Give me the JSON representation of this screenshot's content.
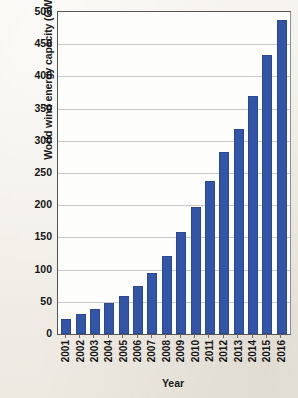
{
  "chart_data": {
    "type": "bar",
    "title": "",
    "xlabel": "Year",
    "ylabel": "World wind energy capacity (GW)",
    "categories": [
      "2001",
      "2002",
      "2003",
      "2004",
      "2005",
      "2006",
      "2007",
      "2008",
      "2009",
      "2010",
      "2011",
      "2012",
      "2013",
      "2014",
      "2015",
      "2016"
    ],
    "values": [
      24,
      31,
      39,
      48,
      59,
      74,
      94,
      121,
      159,
      198,
      238,
      283,
      318,
      370,
      433,
      487
    ],
    "series": [
      {
        "name": "World wind energy capacity",
        "values": [
          24,
          31,
          39,
          48,
          59,
          74,
          94,
          121,
          159,
          198,
          238,
          283,
          318,
          370,
          433,
          487
        ]
      }
    ],
    "ylim": [
      0,
      500
    ],
    "ytick_step": 50,
    "yticks": [
      0,
      50,
      100,
      150,
      200,
      250,
      300,
      350,
      400,
      450,
      500
    ],
    "ytick_labels": [
      "0",
      "50",
      "100",
      "150",
      "200",
      "250",
      "300",
      "350",
      "400",
      "450",
      "500"
    ],
    "grid": "horizontal",
    "legend": "none",
    "bar_color": "#3355a8",
    "plot_background": "#fdfdfb",
    "figure_background": "#f2efe9",
    "gridline_color": "#c9c9cd",
    "axis_color": "#555555"
  }
}
